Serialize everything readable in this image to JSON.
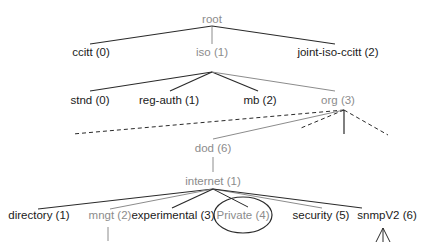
{
  "diagram": {
    "colors": {
      "dark": "#1a1a1a",
      "gray": "#8c8c8c",
      "line_dark": "#2a2a2a",
      "line_gray": "#8c8c8c"
    },
    "nodes": {
      "root": "root",
      "ccitt": "ccitt (0)",
      "iso": "iso (1)",
      "joint": "joint-iso-ccitt (2)",
      "stnd": "stnd (0)",
      "reg_auth": "reg-auth (1)",
      "mb": "mb (2)",
      "org": "org (3)",
      "dod": "dod (6)",
      "internet": "internet (1)",
      "directory": "directory (1)",
      "mngt": "mngt (2)",
      "experimental": "experimental (3)",
      "private": "Private (4)",
      "security": "security (5)",
      "snmpv2": "snmpV2 (6)"
    },
    "highlighted_node": "Private (4)",
    "path": [
      "root",
      "iso (1)",
      "org (3)",
      "dod (6)",
      "internet (1)",
      "mngt (2)"
    ]
  }
}
